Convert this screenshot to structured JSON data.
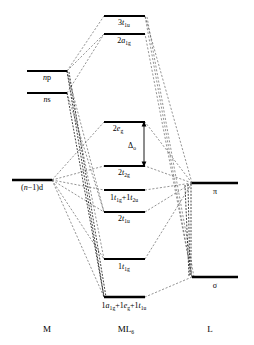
{
  "figure": {
    "type": "molecular-orbital-energy-level-diagram",
    "background_color": "#ffffff",
    "line_color": "#000000",
    "dashed_line_color": "#3a3a3a"
  },
  "columns": [
    {
      "id": "metal",
      "label": "M",
      "x": 47
    },
    {
      "id": "complex",
      "label": "ML",
      "label_sub": "6",
      "x": 126
    },
    {
      "id": "ligand",
      "label": "L",
      "x": 210
    }
  ],
  "column_label_y": 332,
  "metal_levels": [
    {
      "id": "np",
      "label_parts": [
        {
          "text": "n",
          "italic": true
        },
        {
          "text": "p",
          "italic": false
        }
      ],
      "label_text": "np",
      "x1": 27,
      "x2": 67,
      "y": 71,
      "label_x": 47,
      "label_y": 80,
      "degeneracy": 3
    },
    {
      "id": "ns",
      "label_parts": [
        {
          "text": "n",
          "italic": true
        },
        {
          "text": "s",
          "italic": false
        }
      ],
      "label_text": "ns",
      "x1": 27,
      "x2": 67,
      "y": 93,
      "label_x": 47,
      "label_y": 102,
      "degeneracy": 1
    },
    {
      "id": "n-1-d",
      "label_parts": [
        {
          "text": "(",
          "italic": false
        },
        {
          "text": "n",
          "italic": true
        },
        {
          "text": "−1)d",
          "italic": false
        }
      ],
      "label_text": "(n−1)d",
      "x1": 12,
      "x2": 52,
      "y": 180,
      "label_x": 32,
      "label_y": 190,
      "degeneracy": 5
    }
  ],
  "complex_levels": [
    {
      "id": "3t1u",
      "label_text": "3t1u",
      "label_main": "3",
      "label_italic": "t",
      "label_sub": "1u",
      "x1": 104,
      "x2": 145,
      "y": 16,
      "label_x": 124,
      "label_y": 25
    },
    {
      "id": "2a1g",
      "label_text": "2a1g",
      "label_main": "2",
      "label_italic": "a",
      "label_sub": "1g",
      "x1": 104,
      "x2": 145,
      "y": 34,
      "label_x": 124,
      "label_y": 43
    },
    {
      "id": "2eg",
      "label_text": "2eg",
      "label_main": "2",
      "label_italic": "e",
      "label_sub": "g",
      "x1": 104,
      "x2": 145,
      "y": 122,
      "label_x": 120,
      "label_y": 131
    },
    {
      "id": "2t2g",
      "label_text": "2t2g",
      "label_main": "2",
      "label_italic": "t",
      "label_sub": "2g",
      "x1": 104,
      "x2": 145,
      "y": 166,
      "label_x": 124,
      "label_y": 175
    },
    {
      "id": "1t1g+1t2u",
      "label_text": "1t1g+1t2u",
      "x1": 104,
      "x2": 145,
      "y": 190,
      "label_x": 124,
      "label_y": 200
    },
    {
      "id": "2t1u",
      "label_text": "2t1u",
      "label_main": "2",
      "label_italic": "t",
      "label_sub": "1u",
      "x1": 104,
      "x2": 145,
      "y": 212,
      "label_x": 124,
      "label_y": 221
    },
    {
      "id": "1t1g",
      "label_text": "1t1g",
      "label_main": "1",
      "label_italic": "t",
      "label_sub": "1g",
      "x1": 104,
      "x2": 145,
      "y": 259,
      "label_x": 124,
      "label_y": 269
    },
    {
      "id": "1a1g+1eg+1t1u",
      "label_text": "1a1g+1eg+1t1u",
      "x1": 104,
      "x2": 145,
      "y": 297,
      "label_x": 124,
      "label_y": 308
    }
  ],
  "ligand_levels": [
    {
      "id": "pi",
      "label_text": "π",
      "x1": 192,
      "x2": 238,
      "y": 183,
      "label_x": 215,
      "label_y": 193
    },
    {
      "id": "sigma",
      "label_text": "σ",
      "x1": 192,
      "x2": 238,
      "y": 277,
      "label_x": 215,
      "label_y": 287
    }
  ],
  "annotations": [
    {
      "id": "delta-o",
      "label_main": "Δ",
      "label_sub": "o",
      "label_text": "Δo",
      "x": 131,
      "y": 148,
      "arrow_x": 144,
      "arrow_y_top": 122,
      "arrow_y_bottom": 166
    }
  ],
  "correlation_lines": [
    {
      "from": "np",
      "to": "3t1u",
      "x1": 67,
      "y1": 71,
      "x2": 104,
      "y2": 16,
      "style": "light"
    },
    {
      "from": "np",
      "to": "2a1g",
      "x1": 67,
      "y1": 71,
      "x2": 104,
      "y2": 34,
      "style": "light"
    },
    {
      "from": "ns",
      "to": "2a1g",
      "x1": 67,
      "y1": 93,
      "x2": 104,
      "y2": 34,
      "style": "light"
    },
    {
      "from": "pi",
      "to": "3t1u",
      "x1": 192,
      "y1": 183,
      "x2": 145,
      "y2": 16,
      "style": "light"
    },
    {
      "from": "sigma",
      "to": "3t1u",
      "x1": 192,
      "y1": 277,
      "x2": 145,
      "y2": 16,
      "style": "light"
    },
    {
      "from": "sigma",
      "to": "2a1g",
      "x1": 192,
      "y1": 277,
      "x2": 145,
      "y2": 34,
      "style": "light"
    },
    {
      "from": "n-1-d",
      "to": "2eg",
      "x1": 52,
      "y1": 180,
      "x2": 104,
      "y2": 122,
      "style": "light"
    },
    {
      "from": "n-1-d",
      "to": "2t2g",
      "x1": 52,
      "y1": 180,
      "x2": 104,
      "y2": 166,
      "style": "light"
    },
    {
      "from": "pi",
      "to": "2eg",
      "x1": 192,
      "y1": 183,
      "x2": 145,
      "y2": 122,
      "style": "light"
    },
    {
      "from": "pi",
      "to": "2t2g",
      "x1": 192,
      "y1": 183,
      "x2": 145,
      "y2": 166,
      "style": "light"
    },
    {
      "from": "pi",
      "to": "1t1g+1t2u",
      "x1": 192,
      "y1": 183,
      "x2": 145,
      "y2": 190,
      "style": "light"
    },
    {
      "from": "pi",
      "to": "2t1u",
      "x1": 192,
      "y1": 183,
      "x2": 145,
      "y2": 212,
      "style": "light"
    },
    {
      "from": "pi",
      "to": "1t1g",
      "x1": 192,
      "y1": 183,
      "x2": 145,
      "y2": 259,
      "style": "light"
    },
    {
      "from": "sigma",
      "to": "1a1g+1eg+1t1u",
      "x1": 192,
      "y1": 277,
      "x2": 145,
      "y2": 297,
      "style": "light"
    },
    {
      "from": "n-1-d",
      "to": "1t1g",
      "x1": 52,
      "y1": 180,
      "x2": 104,
      "y2": 259,
      "style": "light"
    },
    {
      "from": "n-1-d",
      "to": "1a1g+1eg+1t1u",
      "x1": 52,
      "y1": 180,
      "x2": 104,
      "y2": 297,
      "style": "light"
    },
    {
      "from": "np",
      "to": "1a1g+1eg+1t1u",
      "x1": 67,
      "y1": 71,
      "x2": 104,
      "y2": 297,
      "style": "heavy"
    },
    {
      "from": "ns",
      "to": "1a1g+1eg+1t1u",
      "x1": 67,
      "y1": 93,
      "x2": 104,
      "y2": 297,
      "style": "heavy"
    },
    {
      "from": "np",
      "to": "1t1g",
      "x1": 67,
      "y1": 71,
      "x2": 104,
      "y2": 259,
      "style": "light"
    },
    {
      "from": "ns",
      "to": "2t1u",
      "x1": 67,
      "y1": 93,
      "x2": 104,
      "y2": 212,
      "style": "light"
    },
    {
      "from": "np",
      "to": "2t1u",
      "x1": 67,
      "y1": 71,
      "x2": 104,
      "y2": 212,
      "style": "light"
    },
    {
      "from": "pi",
      "to": "sigma-link",
      "x1": 192,
      "y1": 183,
      "x2": 192,
      "y2": 277,
      "style": "heavy"
    }
  ]
}
